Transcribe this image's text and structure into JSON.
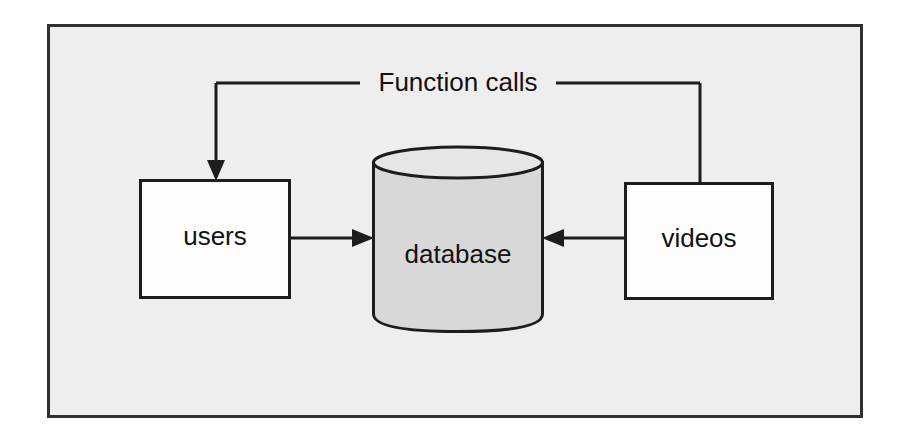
{
  "diagram": {
    "type": "architecture-flow",
    "background_color": "#ffffff",
    "canvas": {
      "fill_color": "#eeeeee",
      "border_color": "#303030"
    },
    "nodes": [
      {
        "id": "users",
        "label": "users",
        "shape": "rectangle",
        "fill_color": "#fdfdfd",
        "border_color": "#1d1d1d"
      },
      {
        "id": "database",
        "label": "database",
        "shape": "cylinder",
        "fill_color": "#d8d8d8",
        "border_color": "#1d1d1d"
      },
      {
        "id": "videos",
        "label": "videos",
        "shape": "rectangle",
        "fill_color": "#fdfdfd",
        "border_color": "#1d1d1d"
      }
    ],
    "edges": [
      {
        "id": "users-to-database",
        "from": "users",
        "to": "database",
        "label": "",
        "arrow": "to"
      },
      {
        "id": "videos-to-database",
        "from": "videos",
        "to": "database",
        "label": "",
        "arrow": "to"
      },
      {
        "id": "videos-to-users",
        "from": "videos",
        "to": "users",
        "label": "Function calls",
        "arrow": "to",
        "routing": "orthogonal-top"
      }
    ],
    "labels": {
      "function_calls": "Function calls",
      "users": "users",
      "database": "database",
      "videos": "videos"
    }
  }
}
